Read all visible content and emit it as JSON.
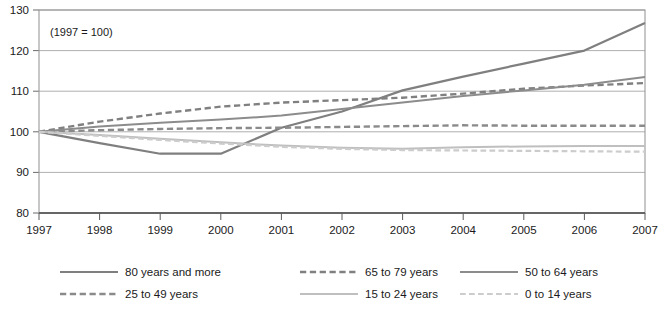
{
  "chart_data": {
    "type": "line",
    "title": "",
    "annotation": "(1997 = 100)",
    "xlabel": "",
    "ylabel": "",
    "x": [
      1997,
      1998,
      1999,
      2000,
      2001,
      2002,
      2003,
      2004,
      2005,
      2006,
      2007
    ],
    "categories": [
      "1997",
      "1998",
      "1999",
      "2000",
      "2001",
      "2002",
      "2003",
      "2004",
      "2005",
      "2006",
      "2007"
    ],
    "xlim": [
      1997,
      2007
    ],
    "ylim": [
      80,
      130
    ],
    "yticks": [
      80,
      90,
      100,
      110,
      120,
      130
    ],
    "ytick_labels": [
      "80",
      "90",
      "100",
      "110",
      "120",
      "130"
    ],
    "grid": "horizontal",
    "legend_position": "bottom",
    "series": [
      {
        "name": "80 years and more",
        "style": "solid",
        "color": "#7f7f7f",
        "width": 2.2,
        "values": [
          100,
          97.2,
          94.6,
          94.6,
          101.0,
          105.0,
          110.2,
          113.6,
          116.8,
          120.0,
          126.8
        ]
      },
      {
        "name": "65 to 79 years",
        "style": "dashed",
        "color": "#808080",
        "width": 2.4,
        "values": [
          100,
          102.5,
          104.5,
          106.2,
          107.2,
          107.8,
          108.4,
          109.4,
          110.6,
          111.4,
          112.0
        ]
      },
      {
        "name": "50 to 64 years",
        "style": "solid",
        "color": "#8c8c8c",
        "width": 2.0,
        "values": [
          100,
          101.3,
          102.2,
          103.0,
          104.0,
          105.6,
          107.2,
          108.8,
          110.2,
          111.6,
          113.5
        ]
      },
      {
        "name": "25 to 49 years",
        "style": "dashed",
        "color": "#8a8a8a",
        "width": 2.4,
        "values": [
          100,
          100.4,
          100.7,
          100.9,
          101.0,
          101.2,
          101.4,
          101.6,
          101.5,
          101.5,
          101.5
        ]
      },
      {
        "name": "15 to 24 years",
        "style": "solid",
        "color": "#bfbfbf",
        "width": 2.0,
        "values": [
          100,
          99.2,
          98.3,
          97.4,
          96.6,
          96.1,
          95.8,
          96.2,
          96.4,
          96.5,
          96.5
        ]
      },
      {
        "name": "0 to 14 years",
        "style": "dashed",
        "color": "#cccccc",
        "width": 2.2,
        "values": [
          100,
          99.0,
          98.0,
          97.1,
          96.3,
          95.8,
          95.5,
          95.4,
          95.3,
          95.2,
          95.1
        ]
      }
    ]
  },
  "legend": {
    "items": [
      {
        "label": "80 years and more",
        "style": "solid",
        "color": "#7f7f7f"
      },
      {
        "label": "65 to 79 years",
        "style": "dashed",
        "color": "#808080"
      },
      {
        "label": "50 to 64 years",
        "style": "solid",
        "color": "#8c8c8c"
      },
      {
        "label": "25 to 49 years",
        "style": "dashed",
        "color": "#8a8a8a"
      },
      {
        "label": "15 to 24 years",
        "style": "solid",
        "color": "#bfbfbf"
      },
      {
        "label": "0 to 14 years",
        "style": "dashed",
        "color": "#cccccc"
      }
    ]
  },
  "style": {
    "plot_border": "#9a9a9a",
    "grid_color": "#a6a6a6",
    "axis_color": "#5a5a5a",
    "background": "#ffffff"
  }
}
